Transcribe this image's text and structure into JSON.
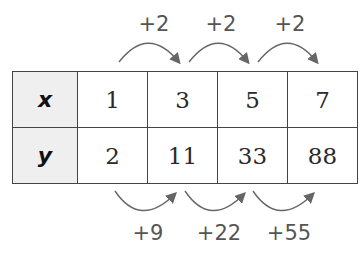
{
  "table": {
    "rows": [
      {
        "header": "x",
        "values": [
          "1",
          "3",
          "5",
          "7"
        ]
      },
      {
        "header": "y",
        "values": [
          "2",
          "11",
          "33",
          "88"
        ]
      }
    ]
  },
  "top_differences": [
    "+2",
    "+2",
    "+2"
  ],
  "bottom_differences": [
    "+9",
    "+22",
    "+55"
  ],
  "colors": {
    "arrow": "#666666",
    "header_bg": "#efefef",
    "border": "#444444"
  }
}
